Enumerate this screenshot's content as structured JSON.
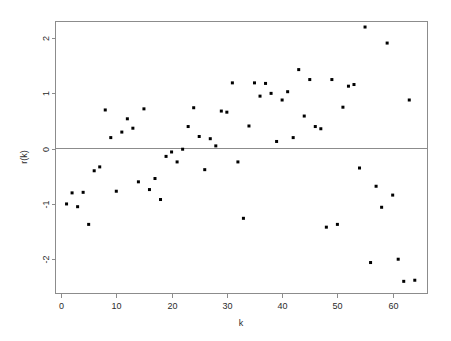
{
  "chart_data": {
    "type": "scatter",
    "title": "",
    "xlabel": "k",
    "ylabel": "r(k)",
    "xlim": [
      -1.0,
      66.3
    ],
    "ylim": [
      -2.62,
      2.3
    ],
    "xticks": [
      0,
      10,
      20,
      30,
      40,
      50,
      60
    ],
    "xticklabels": [
      "0",
      "10",
      "20",
      "30",
      "40",
      "50",
      "60"
    ],
    "yticks": [
      2,
      1,
      0,
      -1,
      -2
    ],
    "yticklabels": [
      "2",
      "1",
      "0",
      "-1",
      "-2"
    ],
    "grid": false,
    "legend": null,
    "reference_lines": [
      {
        "orientation": "horizontal",
        "value": 0,
        "color": "#8c8c8c"
      }
    ],
    "marker": {
      "shape": "square",
      "size": 3,
      "color": "#000000"
    },
    "x": [
      1,
      2,
      3,
      4,
      5,
      6,
      7,
      8,
      9,
      10,
      11,
      12,
      13,
      14,
      15,
      16,
      17,
      18,
      19,
      20,
      21,
      22,
      23,
      24,
      25,
      26,
      27,
      28,
      29,
      30,
      31,
      32,
      33,
      34,
      35,
      36,
      37,
      38,
      39,
      40,
      41,
      42,
      43,
      44,
      45,
      46,
      47,
      48,
      49,
      50,
      51,
      52,
      53,
      54,
      55,
      56,
      57,
      58,
      59,
      60,
      61,
      62,
      63,
      64
    ],
    "y": [
      -1.0,
      -0.8,
      -1.05,
      -0.79,
      -1.37,
      -0.4,
      -0.33,
      0.7,
      0.2,
      -0.77,
      0.3,
      0.54,
      0.37,
      -0.6,
      0.72,
      -0.74,
      -0.54,
      -0.92,
      -0.14,
      -0.06,
      -0.24,
      -0.01,
      0.4,
      0.74,
      0.22,
      -0.38,
      0.18,
      0.05,
      0.68,
      0.66,
      1.19,
      -0.24,
      -1.26,
      0.41,
      1.19,
      0.95,
      1.18,
      1.0,
      0.13,
      0.88,
      1.03,
      0.2,
      1.43,
      0.59,
      1.25,
      0.4,
      0.36,
      -1.42,
      1.25,
      -1.37,
      0.75,
      1.13,
      1.16,
      -0.35,
      2.2,
      -2.06,
      -0.68,
      -1.06,
      1.91,
      -0.84,
      -2.0,
      -2.4,
      0.88,
      -2.38
    ],
    "point_count": 64
  },
  "axes": {
    "x_axis_title": "k",
    "y_axis_title": "r(k)"
  }
}
